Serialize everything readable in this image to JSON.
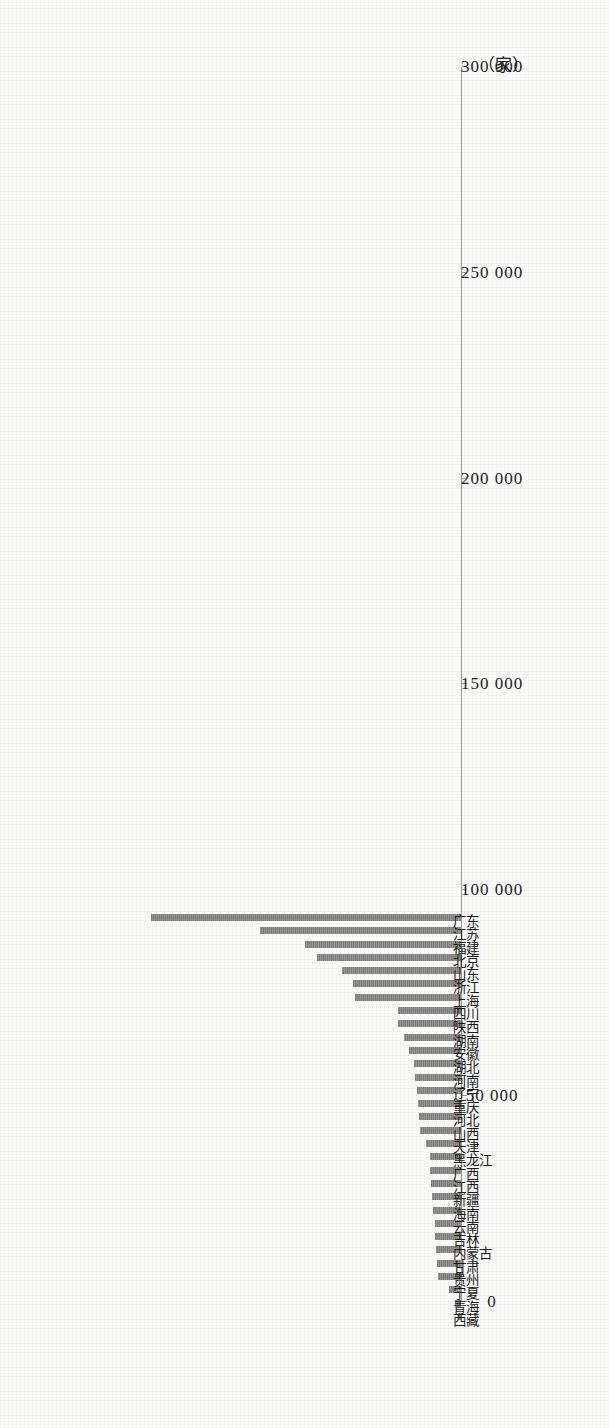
{
  "chart_data": {
    "type": "bar",
    "title": "",
    "subtitle": "",
    "xlabel": "",
    "ylabel": "",
    "unit_label": "（家）",
    "orientation": "vertical-bars-on-rotated-page",
    "grid": false,
    "legend": null,
    "ylim": [
      0,
      300000
    ],
    "ytick_labels": [
      "0",
      "50 000",
      "100 000",
      "150 000",
      "200 000",
      "250 000",
      "300 000"
    ],
    "ytick_values": [
      0,
      50000,
      100000,
      150000,
      200000,
      250000,
      300000
    ],
    "categories": [
      "西藏",
      "青海",
      "宁夏",
      "贵州",
      "甘肃",
      "内蒙古",
      "吉林",
      "云南",
      "海南",
      "新疆",
      "江西",
      "广西",
      "黑龙江",
      "天津",
      "山西",
      "河北",
      "重庆",
      "辽宁",
      "河南",
      "湖北",
      "安徽",
      "湖南",
      "陕西",
      "四川",
      "上海",
      "浙江",
      "山东",
      "北京",
      "福建",
      "江苏",
      "广东"
    ],
    "values": [
      2500,
      5500,
      11000,
      21000,
      21500,
      23000,
      23500,
      24000,
      25500,
      26000,
      27500,
      28000,
      28500,
      32000,
      37500,
      38500,
      39500,
      40000,
      41500,
      42500,
      47000,
      52000,
      57500,
      57500,
      96000,
      98000,
      108000,
      131000,
      142000,
      183000,
      282000
    ]
  },
  "axis": {
    "unit_label": "（家）"
  }
}
